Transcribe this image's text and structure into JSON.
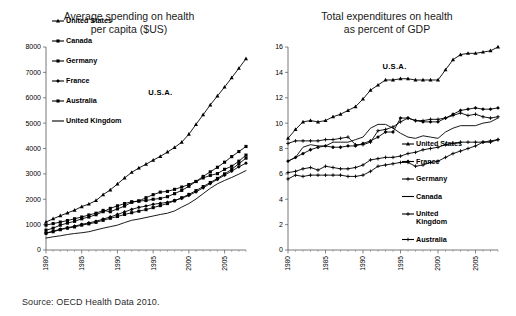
{
  "source_note": "Source: OECD Health Data 2010.",
  "chart_data": [
    {
      "id": "spending-per-capita",
      "type": "line",
      "title": "Average spending on health\nper capita ($US)",
      "xlabel": "",
      "ylabel": "",
      "xlim": [
        1980,
        2008
      ],
      "ylim": [
        0,
        8000
      ],
      "ytick_labels": [
        "0",
        "1000",
        "2000",
        "3000",
        "4000",
        "5000",
        "6000",
        "7000",
        "8000"
      ],
      "ytick_values": [
        0,
        1000,
        2000,
        3000,
        4000,
        5000,
        6000,
        7000,
        8000
      ],
      "xtick_labels": [
        "1980",
        "1985",
        "1990",
        "1995",
        "2000",
        "2005"
      ],
      "xtick_values": [
        1980,
        1985,
        1990,
        1995,
        2000,
        2005
      ],
      "grid": false,
      "legend_position": "upper-left-inside",
      "annotations": [
        {
          "text": "U.S.A.",
          "x": 1996,
          "y": 6100
        }
      ],
      "x": [
        1980,
        1981,
        1982,
        1983,
        1984,
        1985,
        1986,
        1987,
        1988,
        1989,
        1990,
        1991,
        1992,
        1993,
        1994,
        1995,
        1996,
        1997,
        1998,
        1999,
        2000,
        2001,
        2002,
        2003,
        2004,
        2005,
        2006,
        2007,
        2008
      ],
      "series": [
        {
          "name": "United States",
          "marker": "triangle",
          "values": [
            1100,
            1230,
            1350,
            1460,
            1570,
            1710,
            1810,
            1950,
            2180,
            2370,
            2600,
            2840,
            3060,
            3230,
            3380,
            3540,
            3690,
            3860,
            4040,
            4250,
            4560,
            4950,
            5330,
            5720,
            6070,
            6420,
            6790,
            7160,
            7540
          ]
        },
        {
          "name": "Canada",
          "marker": "square",
          "values": [
            780,
            860,
            980,
            1060,
            1130,
            1230,
            1300,
            1390,
            1510,
            1640,
            1740,
            1830,
            1900,
            1930,
            1950,
            2000,
            2030,
            2100,
            2220,
            2350,
            2510,
            2700,
            2900,
            3080,
            3260,
            3460,
            3680,
            3880,
            4080
          ]
        },
        {
          "name": "Germany",
          "marker": "square",
          "values": [
            980,
            1040,
            1100,
            1160,
            1230,
            1300,
            1380,
            1450,
            1560,
            1510,
            1620,
            1730,
            1880,
            1930,
            2060,
            2180,
            2280,
            2310,
            2390,
            2480,
            2580,
            2700,
            2840,
            2940,
            3010,
            3180,
            3300,
            3500,
            3740
          ]
        },
        {
          "name": "France",
          "marker": "diamond",
          "values": [
            670,
            740,
            820,
            880,
            940,
            1010,
            1070,
            1130,
            1220,
            1300,
            1400,
            1500,
            1600,
            1680,
            1730,
            1800,
            1840,
            1880,
            1950,
            2040,
            2150,
            2290,
            2450,
            2620,
            2780,
            2950,
            3110,
            3280,
            3420
          ]
        },
        {
          "name": "Australia",
          "marker": "square",
          "values": [
            660,
            720,
            800,
            860,
            910,
            980,
            1030,
            1090,
            1170,
            1250,
            1320,
            1400,
            1470,
            1530,
            1590,
            1670,
            1750,
            1830,
            1940,
            2060,
            2190,
            2340,
            2500,
            2660,
            2820,
            3000,
            3180,
            3400,
            3620
          ]
        },
        {
          "name": "United Kingdom",
          "marker": "none",
          "values": [
            470,
            520,
            560,
            610,
            650,
            680,
            720,
            790,
            860,
            920,
            980,
            1080,
            1170,
            1220,
            1280,
            1340,
            1400,
            1450,
            1540,
            1690,
            1830,
            2010,
            2220,
            2430,
            2610,
            2740,
            2860,
            2990,
            3130
          ]
        }
      ]
    },
    {
      "id": "expenditure-percent-gdp",
      "type": "line",
      "title": "Total expenditures on health\nas percent of GDP",
      "xlabel": "",
      "ylabel": "",
      "xlim": [
        1980,
        2008
      ],
      "ylim": [
        0,
        16
      ],
      "ytick_labels": [
        "0",
        "2",
        "4",
        "6",
        "8",
        "10",
        "12",
        "14",
        "16"
      ],
      "ytick_values": [
        0,
        2,
        4,
        6,
        8,
        10,
        12,
        14,
        16
      ],
      "xtick_labels": [
        "1980",
        "1985",
        "1990",
        "1995",
        "2000",
        "2005"
      ],
      "xtick_values": [
        1980,
        1985,
        1990,
        1995,
        2000,
        2005
      ],
      "grid": false,
      "legend_position": "lower-right-inside",
      "annotations": [
        {
          "text": "U.S.A.",
          "x": 1994.2,
          "y": 14.3
        }
      ],
      "x": [
        1980,
        1981,
        1982,
        1983,
        1984,
        1985,
        1986,
        1987,
        1988,
        1989,
        1990,
        1991,
        1992,
        1993,
        1994,
        1995,
        1996,
        1997,
        1998,
        1999,
        2000,
        2001,
        2002,
        2003,
        2004,
        2005,
        2006,
        2007,
        2008
      ],
      "series": [
        {
          "name": "United States",
          "marker": "triangle",
          "values": [
            8.8,
            9.5,
            10.1,
            10.2,
            10.1,
            10.2,
            10.5,
            10.7,
            11.0,
            11.3,
            11.9,
            12.6,
            13.0,
            13.4,
            13.4,
            13.5,
            13.5,
            13.4,
            13.4,
            13.4,
            13.4,
            14.2,
            15.0,
            15.4,
            15.5,
            15.5,
            15.6,
            15.7,
            16.0
          ]
        },
        {
          "name": "France",
          "marker": "diamond",
          "values": [
            7.0,
            7.3,
            7.6,
            7.9,
            8.1,
            8.2,
            8.1,
            8.1,
            8.2,
            8.2,
            8.4,
            8.6,
            8.9,
            9.3,
            9.3,
            10.4,
            10.4,
            10.2,
            10.1,
            10.1,
            10.1,
            10.4,
            10.7,
            11.0,
            11.1,
            11.2,
            11.1,
            11.1,
            11.2
          ]
        },
        {
          "name": "Germany",
          "marker": "plus",
          "values": [
            8.4,
            8.6,
            8.6,
            8.6,
            8.6,
            8.7,
            8.7,
            8.8,
            8.9,
            8.3,
            8.3,
            8.5,
            9.4,
            9.5,
            9.7,
            10.1,
            10.4,
            10.2,
            10.2,
            10.3,
            10.3,
            10.4,
            10.6,
            10.8,
            10.6,
            10.7,
            10.5,
            10.4,
            10.5
          ]
        },
        {
          "name": "Canada",
          "marker": "none",
          "values": [
            7.0,
            7.3,
            8.1,
            8.3,
            8.2,
            8.2,
            8.5,
            8.5,
            8.5,
            8.7,
            8.9,
            9.6,
            9.9,
            9.9,
            9.6,
            9.2,
            8.9,
            8.8,
            9.0,
            8.9,
            8.8,
            9.3,
            9.6,
            9.8,
            9.8,
            9.8,
            10.0,
            10.1,
            10.4
          ]
        },
        {
          "name": "United Kingdom",
          "marker": "plus",
          "values": [
            5.6,
            5.9,
            5.8,
            5.9,
            5.9,
            5.9,
            5.9,
            5.9,
            5.8,
            5.8,
            5.9,
            6.2,
            6.6,
            6.7,
            6.8,
            6.9,
            6.9,
            6.6,
            6.7,
            6.9,
            7.0,
            7.3,
            7.6,
            7.8,
            8.0,
            8.2,
            8.5,
            8.5,
            8.7
          ]
        },
        {
          "name": "Australia",
          "marker": "plus",
          "values": [
            6.1,
            6.2,
            6.4,
            6.5,
            6.3,
            6.6,
            6.5,
            6.4,
            6.4,
            6.5,
            6.7,
            7.1,
            7.2,
            7.3,
            7.3,
            7.4,
            7.6,
            7.7,
            7.9,
            8.0,
            8.1,
            8.3,
            8.4,
            8.5,
            8.5,
            8.5,
            8.5,
            8.6,
            8.7
          ]
        }
      ]
    }
  ]
}
